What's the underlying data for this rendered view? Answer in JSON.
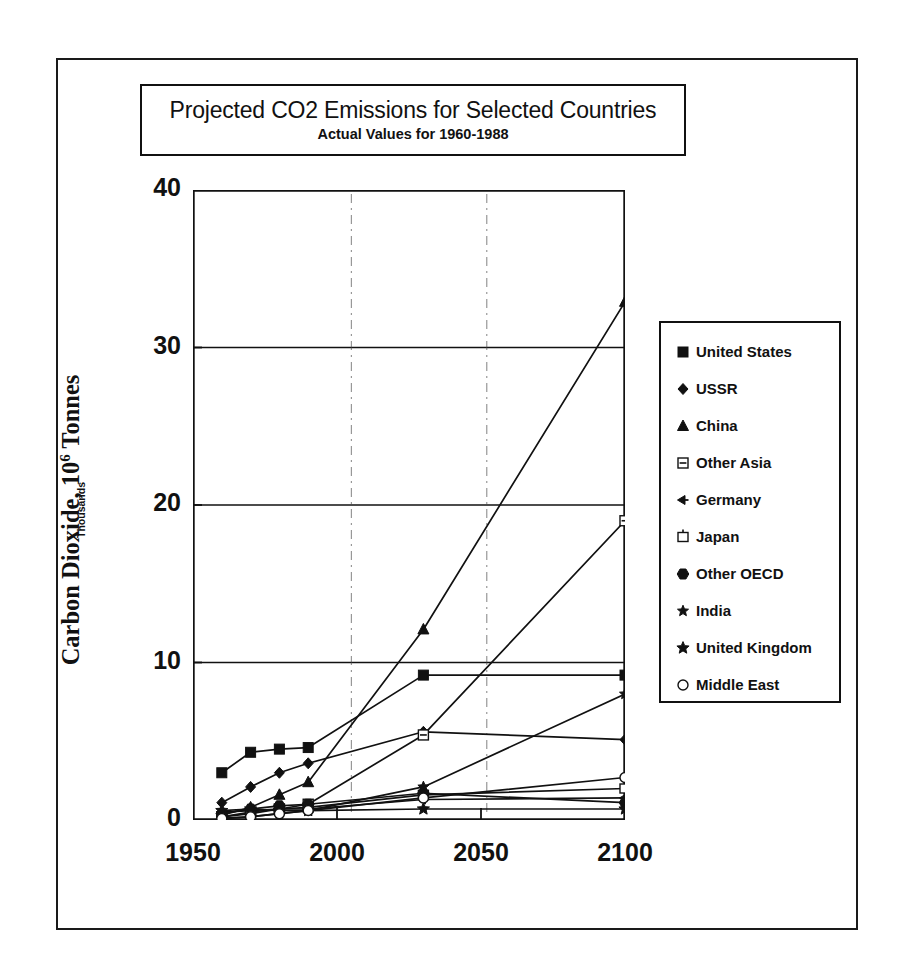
{
  "title": {
    "main": "Projected CO2 Emissions for Selected Countries",
    "sub": "Actual Values for 1960-1988"
  },
  "axes": {
    "ylabel_main": "Carbon Dioxide, 10",
    "ylabel_exp": "6",
    "ylabel_main_tail": " Tonnes",
    "ylabel_sub": "Thousands",
    "ytick_labels": [
      "40",
      "30",
      "20",
      "10",
      "0"
    ],
    "xtick_labels": [
      "1950",
      "2000",
      "2050",
      "2100"
    ]
  },
  "legend": {
    "items": [
      {
        "label": "United States",
        "marker": "filled-square"
      },
      {
        "label": "USSR",
        "marker": "filled-diamond-small"
      },
      {
        "label": "China",
        "marker": "filled-triangle"
      },
      {
        "label": "Other Asia",
        "marker": "open-square-bar"
      },
      {
        "label": "Germany",
        "marker": "left-arrow"
      },
      {
        "label": "Japan",
        "marker": "open-square-dot"
      },
      {
        "label": "Other OECD",
        "marker": "filled-hexagon"
      },
      {
        "label": "India",
        "marker": "filled-star-small"
      },
      {
        "label": "United Kingdom",
        "marker": "filled-star"
      },
      {
        "label": "Middle East",
        "marker": "open-circle"
      }
    ]
  },
  "colors": {
    "ink": "#111111",
    "background": "#ffffff",
    "grid": "#222222"
  },
  "chart_data": {
    "type": "line",
    "title": "Projected CO2 Emissions for Selected Countries",
    "subtitle": "Actual Values for 1960-1988",
    "xlabel": "",
    "ylabel": "Carbon Dioxide, 10^6 Tonnes (Thousands)",
    "xlim": [
      1950,
      2100
    ],
    "ylim": [
      0,
      40
    ],
    "xticks": [
      1950,
      2000,
      2050,
      2100
    ],
    "yticks": [
      0,
      10,
      20,
      30,
      40
    ],
    "grid": true,
    "legend_position": "right-outside",
    "x": [
      1960,
      1970,
      1980,
      1990,
      2030,
      2100
    ],
    "series": [
      {
        "name": "United States",
        "marker": "filled-square",
        "values": [
          3.0,
          4.3,
          4.5,
          4.6,
          9.2,
          9.2
        ]
      },
      {
        "name": "USSR",
        "marker": "filled-diamond-small",
        "values": [
          1.1,
          2.1,
          3.0,
          3.6,
          5.6,
          5.1
        ]
      },
      {
        "name": "China",
        "marker": "filled-triangle",
        "values": [
          0.3,
          0.8,
          1.6,
          2.4,
          12.1,
          32.9
        ]
      },
      {
        "name": "Other Asia",
        "marker": "open-square-bar",
        "values": [
          0.2,
          0.4,
          0.7,
          1.0,
          5.4,
          19.0
        ]
      },
      {
        "name": "Germany",
        "marker": "left-arrow",
        "values": [
          0.5,
          0.6,
          0.7,
          0.7,
          1.3,
          1.4
        ]
      },
      {
        "name": "Japan",
        "marker": "open-square-dot",
        "values": [
          0.2,
          0.5,
          0.7,
          0.8,
          1.6,
          2.0
        ]
      },
      {
        "name": "Other OECD",
        "marker": "filled-hexagon",
        "values": [
          0.4,
          0.7,
          0.9,
          1.0,
          1.7,
          1.1
        ]
      },
      {
        "name": "India",
        "marker": "filled-star-small",
        "values": [
          0.1,
          0.2,
          0.4,
          0.6,
          2.1,
          8.0
        ]
      },
      {
        "name": "United Kingdom",
        "marker": "filled-star",
        "values": [
          0.6,
          0.7,
          0.6,
          0.6,
          0.7,
          0.7
        ]
      },
      {
        "name": "Middle East",
        "marker": "open-circle",
        "values": [
          0.1,
          0.2,
          0.4,
          0.6,
          1.4,
          2.7
        ]
      }
    ]
  }
}
